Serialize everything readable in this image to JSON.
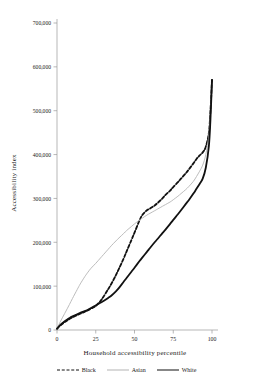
{
  "chart_data": {
    "type": "line",
    "title": "",
    "xlabel": "Household accessibility percentile",
    "ylabel": "Accessibility index",
    "xlim": [
      0,
      100
    ],
    "ylim": [
      0,
      700000
    ],
    "xticks": [
      0,
      25,
      50,
      75,
      100
    ],
    "xticklabels": [
      "0",
      "25",
      "50",
      "75",
      "100"
    ],
    "yticks": [
      0,
      100000,
      200000,
      300000,
      400000,
      500000,
      600000,
      700000
    ],
    "yticklabels": [
      "0",
      "100,000",
      "200,000",
      "300,000",
      "400,000",
      "500,000",
      "600,000",
      "700,000"
    ],
    "grid": false,
    "legend_position": "bottom",
    "x": [
      0,
      2,
      5,
      8,
      10,
      13,
      15,
      18,
      20,
      22,
      25,
      28,
      30,
      33,
      35,
      38,
      40,
      43,
      45,
      48,
      50,
      53,
      55,
      58,
      60,
      63,
      65,
      68,
      70,
      73,
      75,
      78,
      80,
      83,
      85,
      88,
      90,
      92,
      94,
      96,
      98,
      99,
      100
    ],
    "series": [
      {
        "name": "Black",
        "color": "#111111",
        "style": "dashed",
        "width": 1.8,
        "values": [
          3000,
          10000,
          18000,
          25000,
          29000,
          34000,
          37000,
          42000,
          45000,
          49000,
          55000,
          66000,
          76000,
          93000,
          105000,
          125000,
          140000,
          163000,
          180000,
          205000,
          222000,
          248000,
          262000,
          273000,
          277000,
          284000,
          290000,
          300000,
          308000,
          318000,
          326000,
          337000,
          345000,
          357000,
          366000,
          380000,
          390000,
          398000,
          405000,
          418000,
          450000,
          500000,
          570000
        ]
      },
      {
        "name": "Asian",
        "color": "#b4b4b4",
        "style": "solid",
        "width": 0.9,
        "values": [
          3000,
          18000,
          38000,
          58000,
          72000,
          92000,
          105000,
          122000,
          132000,
          141000,
          152000,
          164000,
          172000,
          184000,
          192000,
          203000,
          210000,
          220000,
          227000,
          236000,
          242000,
          250000,
          255000,
          262000,
          266000,
          272000,
          276000,
          282000,
          286000,
          292000,
          297000,
          305000,
          311000,
          320000,
          327000,
          339000,
          350000,
          362000,
          376000,
          400000,
          445000,
          495000,
          565000
        ]
      },
      {
        "name": "White",
        "color": "#111111",
        "style": "solid",
        "width": 1.8,
        "values": [
          3000,
          11000,
          20000,
          27000,
          31000,
          36000,
          39000,
          43000,
          46000,
          50000,
          56000,
          62000,
          66000,
          73000,
          78000,
          88000,
          96000,
          110000,
          119000,
          133000,
          142000,
          156000,
          165000,
          178000,
          187000,
          200000,
          208000,
          221000,
          229000,
          242000,
          251000,
          264000,
          273000,
          287000,
          296000,
          311000,
          322000,
          333000,
          345000,
          370000,
          420000,
          480000,
          570000
        ]
      }
    ]
  },
  "legend": {
    "items": [
      {
        "label": "Black"
      },
      {
        "label": "Asian"
      },
      {
        "label": "White"
      }
    ]
  }
}
